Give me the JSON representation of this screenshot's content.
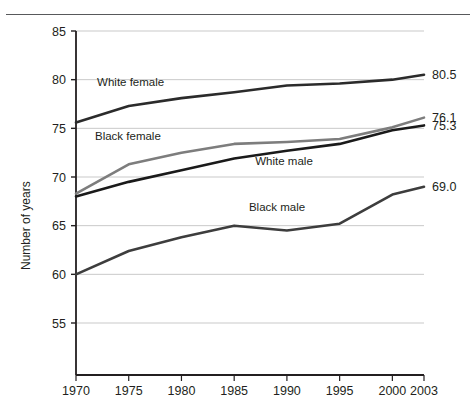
{
  "chart_data": {
    "type": "line",
    "title": "",
    "subtitle": "",
    "xlabel": "",
    "ylabel": "Number of years",
    "x": [
      1970,
      1975,
      1980,
      1985,
      1990,
      1995,
      2000,
      2003
    ],
    "xlim": [
      1970,
      2003
    ],
    "ylim": [
      53,
      85
    ],
    "xticks": [
      "1970",
      "1975",
      "1980",
      "1985",
      "1990",
      "1995",
      "2000",
      "2003"
    ],
    "yticks": [
      "55",
      "60",
      "65",
      "70",
      "75",
      "80",
      "85"
    ],
    "grid": "horizontal",
    "legend_position": "inline-annotations",
    "series": [
      {
        "name": "White female",
        "color": "#2b2b2b",
        "values": [
          75.6,
          77.3,
          78.1,
          78.7,
          79.4,
          79.6,
          80.0,
          80.5
        ],
        "end_label": "80.5",
        "label_x": 1972.0,
        "label_y": 79.3
      },
      {
        "name": "Black female",
        "color": "#7d7d7d",
        "values": [
          68.3,
          71.3,
          72.5,
          73.4,
          73.6,
          73.9,
          75.1,
          76.1
        ],
        "end_label": "76.1",
        "label_x": 1971.8,
        "label_y": 73.8
      },
      {
        "name": "White male",
        "color": "#1a1a1a",
        "values": [
          68.0,
          69.5,
          70.7,
          71.9,
          72.7,
          73.4,
          74.8,
          75.3
        ],
        "end_label": "75.3",
        "label_x": 1987.0,
        "label_y": 71.2
      },
      {
        "name": "Black male",
        "color": "#3d3d3d",
        "values": [
          60.0,
          62.4,
          63.8,
          65.0,
          64.5,
          65.2,
          68.2,
          69.0
        ],
        "end_label": "69.0",
        "label_x": 1986.4,
        "label_y": 66.5
      }
    ]
  },
  "axis": {
    "y_title": "Number of years"
  }
}
